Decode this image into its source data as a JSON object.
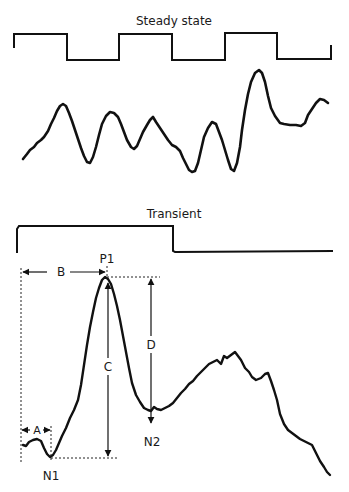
{
  "steady": {
    "title": "Steady state",
    "stimulus_points": "14,48 14,34 67,34 67,60 119,60 119,34 172,34 172,60 225,60 225,33 277,33 277,59 331,59 331,45",
    "response_points": "23,159 27,154 30,150 34,147 37,143 41,140 44,137 48,131 51,124 54,118 57,111 60,106 63,104 66,106 69,113 72,121 75,130 78,139 81,148 84,156 87,162 90,163 93,157 96,147 99,135 102,124 106,116 110,112 114,113 118,117 121,124 124,132 127,140 131,147 134,149 137,146 140,139 143,132 147,125 150,120 153,117 156,122 160,128 164,134 168,140 172,145 176,147 180,151 183,158 186,164 189,170 192,172 195,171 198,163 201,150 204,137 208,128 212,122 216,124 219,132 222,140 225,150 228,160 231,169 234,171 237,163 240,147 242,130 245,110 248,94 251,82 255,73 259,70 262,73 265,82 268,96 271,108 275,116 280,123 284,124 290,125 296,125 301,126 305,123 308,115 312,109 316,103 320,99 324,100 328,103"
  },
  "transient": {
    "title": "Transient",
    "stimulus_points": "17,253 17,229 19,226 173,226 173,251 175,252 333,251",
    "response_points": "23,445 26,446 29,442 33,440 37,439 41,441 44,448 47,454 50,457 53,455 56,450 59,443 62,436 66,428 70,418 74,410 78,400 81,385 84,365 87,345 90,327 93,312 96,298 99,288 102,280 105,277 108,279 111,284 114,294 117,306 120,320 123,336 126,352 129,368 132,383 136,395 140,402 144,408 148,410 151,411 154,407 157,409 161,410 165,408 169,406 173,403 177,398 181,393 185,389 189,384 193,381 197,376 201,372 205,368 209,364 213,362 217,360 221,364 224,356 227,358 231,355 235,352 238,356 241,360 245,368 249,372 252,377 256,380 261,378 265,374 268,373 271,381 274,390 277,400 280,414 284,424 288,430 292,433 296,436 300,439 304,441 308,443 312,445 316,453 320,461 324,467 327,472 330,475",
    "labels": {
      "P1": "P1",
      "N1": "N1",
      "N2": "N2",
      "A": "A",
      "B": "B",
      "C": "C",
      "D": "D"
    }
  }
}
